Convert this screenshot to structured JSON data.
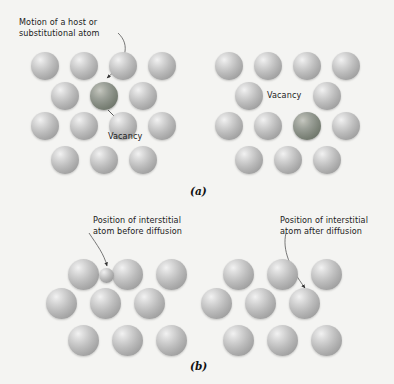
{
  "figure": {
    "background_color": "#f4f4f2",
    "atom_color": "#b4b4b4",
    "highlight_atom_color": "#7b8277",
    "text_color": "#1b1b1b"
  },
  "panels": [
    {
      "id": "a",
      "label": "(a)",
      "mechanism": "vacancy diffusion",
      "diagrams": [
        {
          "id": "a-left",
          "callouts": [
            {
              "name": "motion-label",
              "text": "Motion of a host or\nsubstitutional atom"
            },
            {
              "name": "vacancy-label",
              "text": "Vacancy"
            }
          ],
          "atoms": [
            {
              "row": 1,
              "col": 1,
              "type": "host"
            },
            {
              "row": 1,
              "col": 2,
              "type": "host"
            },
            {
              "row": 1,
              "col": 3,
              "type": "host"
            },
            {
              "row": 1,
              "col": 4,
              "type": "host"
            },
            {
              "row": 2,
              "col": 1,
              "type": "host"
            },
            {
              "row": 2,
              "col": 2,
              "type": "highlight"
            },
            {
              "row": 2,
              "col": 3,
              "type": "host"
            },
            {
              "row": 3,
              "col": 1,
              "type": "host"
            },
            {
              "row": 3,
              "col": 2,
              "type": "host"
            },
            {
              "row": 3,
              "col": 3,
              "type": "host"
            },
            {
              "row": 3,
              "col": 4,
              "type": "host"
            },
            {
              "row": 4,
              "col": 1,
              "type": "host"
            },
            {
              "row": 4,
              "col": 2,
              "type": "host"
            },
            {
              "row": 4,
              "col": 3,
              "type": "host"
            }
          ]
        },
        {
          "id": "a-right",
          "callouts": [
            {
              "name": "vacancy-label",
              "text": "Vacancy"
            }
          ],
          "atoms": [
            {
              "row": 1,
              "col": 1,
              "type": "host"
            },
            {
              "row": 1,
              "col": 2,
              "type": "host"
            },
            {
              "row": 1,
              "col": 3,
              "type": "host"
            },
            {
              "row": 1,
              "col": 4,
              "type": "host"
            },
            {
              "row": 2,
              "col": 1,
              "type": "host"
            },
            {
              "row": 2,
              "col": 3,
              "type": "host"
            },
            {
              "row": 3,
              "col": 1,
              "type": "host"
            },
            {
              "row": 3,
              "col": 2,
              "type": "host"
            },
            {
              "row": 3,
              "col": 3,
              "type": "highlight"
            },
            {
              "row": 3,
              "col": 4,
              "type": "host"
            },
            {
              "row": 4,
              "col": 1,
              "type": "host"
            },
            {
              "row": 4,
              "col": 2,
              "type": "host"
            },
            {
              "row": 4,
              "col": 3,
              "type": "host"
            }
          ]
        }
      ]
    },
    {
      "id": "b",
      "label": "(b)",
      "mechanism": "interstitial diffusion",
      "diagrams": [
        {
          "id": "b-left",
          "callouts": [
            {
              "name": "interstitial-before-label",
              "text": "Position of interstitial\natom before diffusion"
            }
          ],
          "atoms": [
            {
              "row": 1,
              "col": 1,
              "type": "host"
            },
            {
              "row": 1,
              "col": 2,
              "type": "host"
            },
            {
              "row": 1,
              "col": 3,
              "type": "host"
            },
            {
              "row": 2,
              "col": 1,
              "type": "host"
            },
            {
              "row": 2,
              "col": 2,
              "type": "host"
            },
            {
              "row": 2,
              "col": 3,
              "type": "host"
            },
            {
              "row": 3,
              "col": 1,
              "type": "host"
            },
            {
              "row": 3,
              "col": 2,
              "type": "host"
            },
            {
              "row": 3,
              "col": 3,
              "type": "host"
            },
            {
              "row": 0,
              "col": 0,
              "type": "interstitial"
            }
          ]
        },
        {
          "id": "b-right",
          "callouts": [
            {
              "name": "interstitial-after-label",
              "text": "Position of interstitial\natom after diffusion"
            }
          ],
          "atoms": [
            {
              "row": 1,
              "col": 1,
              "type": "host"
            },
            {
              "row": 1,
              "col": 2,
              "type": "host"
            },
            {
              "row": 1,
              "col": 3,
              "type": "host"
            },
            {
              "row": 2,
              "col": 1,
              "type": "host"
            },
            {
              "row": 2,
              "col": 2,
              "type": "host"
            },
            {
              "row": 2,
              "col": 3,
              "type": "host"
            },
            {
              "row": 3,
              "col": 1,
              "type": "host"
            },
            {
              "row": 3,
              "col": 2,
              "type": "host"
            },
            {
              "row": 3,
              "col": 3,
              "type": "host"
            },
            {
              "row": 0,
              "col": 0,
              "type": "interstitial"
            }
          ]
        }
      ]
    }
  ],
  "callouts": {
    "motion_host": "Motion of a host or\nsubstitutional atom",
    "vacancy_left": "Vacancy",
    "vacancy_right": "Vacancy",
    "interstitial_before": "Position of interstitial\natom before diffusion",
    "interstitial_after": "Position of interstitial\natom after diffusion",
    "panel_a": "(a)",
    "panel_b": "(b)"
  }
}
